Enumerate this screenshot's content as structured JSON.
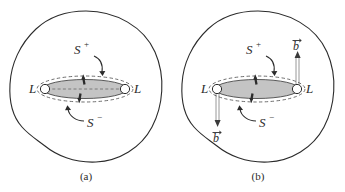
{
  "figure": {
    "background_color": "#ffffff",
    "stroke_color": "#2b2b2b",
    "disk_fill_color": "#c4c4c4",
    "dashed_color": "#555555",
    "panels": [
      {
        "id": "a",
        "caption": "(a)",
        "labels": {
          "left_boundary": "L",
          "right_boundary": "L",
          "upper_surface": "S",
          "upper_surface_sign": "+",
          "lower_surface": "S",
          "lower_surface_sign": "−"
        },
        "icons": [
          "normal-vector-up-arrow",
          "normal-vector-down-arrow",
          "boundary-circle-left",
          "boundary-circle-right",
          "region-outline-blob",
          "disk-ellipse",
          "dashed-ellipse-outline",
          "leader-line-s-plus",
          "leader-line-s-minus"
        ]
      },
      {
        "id": "b",
        "caption": "(b)",
        "labels": {
          "left_boundary": "L",
          "right_boundary": "L",
          "upper_surface": "S",
          "upper_surface_sign": "+",
          "lower_surface": "S",
          "lower_surface_sign": "−",
          "left_vector": "b",
          "right_vector": "b"
        },
        "icons": [
          "normal-vector-up-arrow",
          "normal-vector-down-arrow",
          "boundary-circle-left",
          "boundary-circle-right",
          "region-outline-blob",
          "disk-ellipse",
          "dashed-ellipse-outline",
          "leader-line-s-plus",
          "leader-line-s-minus",
          "b-vector-up-ribbon",
          "b-vector-down-ribbon"
        ]
      }
    ]
  }
}
